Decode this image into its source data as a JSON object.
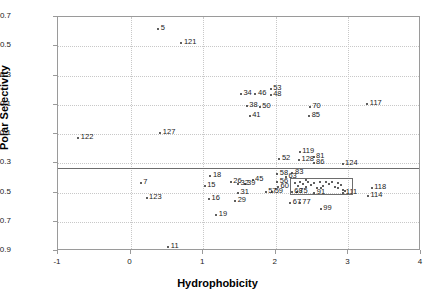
{
  "chart_data": {
    "type": "scatter",
    "title": "",
    "xlabel": "Hydrophobicity",
    "ylabel": "Polar Selectivity",
    "xlim": [
      -1,
      4
    ],
    "ylim": [
      -0.9,
      0.7
    ],
    "xticks": [
      "-1",
      "0",
      "1",
      "2",
      "3",
      "4"
    ],
    "xtick_values": [
      -1,
      0,
      1,
      2,
      3,
      4
    ],
    "yticks": [
      "0.7",
      "0.5",
      "0.3",
      "0.1",
      "-0.1",
      "-0.3",
      "-0.5",
      "-0.7",
      "-0.9"
    ],
    "ytick_values": [
      0.7,
      0.5,
      0.3,
      0.1,
      -0.1,
      -0.3,
      -0.5,
      -0.7,
      -0.9
    ],
    "grid": "dotted-both",
    "legend": "none",
    "marker_color": "#2a2a2a",
    "reference_line": {
      "orientation": "horizontal",
      "y": -0.33,
      "color": "#6d6d6d"
    },
    "inset_box": {
      "x0": 2.2,
      "x1": 3.06,
      "y0": -0.52,
      "y1": -0.4,
      "color": "#6d6d6d"
    },
    "labeled_points": [
      {
        "label": "5",
        "x": 0.38,
        "y": 0.615
      },
      {
        "label": "121",
        "x": 0.7,
        "y": 0.525
      },
      {
        "label": "122",
        "x": -0.72,
        "y": -0.125
      },
      {
        "label": "127",
        "x": 0.41,
        "y": -0.09
      },
      {
        "label": "34",
        "x": 1.52,
        "y": 0.175
      },
      {
        "label": "46",
        "x": 1.72,
        "y": 0.175
      },
      {
        "label": "53",
        "x": 1.93,
        "y": 0.205
      },
      {
        "label": "48",
        "x": 1.93,
        "y": 0.165
      },
      {
        "label": "38",
        "x": 1.6,
        "y": 0.09
      },
      {
        "label": "50",
        "x": 1.78,
        "y": 0.085
      },
      {
        "label": "41",
        "x": 1.64,
        "y": 0.02
      },
      {
        "label": "70",
        "x": 2.47,
        "y": 0.085
      },
      {
        "label": "85",
        "x": 2.46,
        "y": 0.025
      },
      {
        "label": "117",
        "x": 3.26,
        "y": 0.105
      },
      {
        "label": "119",
        "x": 2.33,
        "y": -0.225
      },
      {
        "label": "128",
        "x": 2.32,
        "y": -0.275
      },
      {
        "label": "81",
        "x": 2.52,
        "y": -0.255
      },
      {
        "label": "86",
        "x": 2.52,
        "y": -0.295
      },
      {
        "label": "124",
        "x": 2.92,
        "y": -0.305
      },
      {
        "label": "52",
        "x": 2.05,
        "y": -0.27
      },
      {
        "label": "58",
        "x": 2.02,
        "y": -0.375
      },
      {
        "label": "83",
        "x": 2.23,
        "y": -0.365
      },
      {
        "label": "63",
        "x": 2.14,
        "y": -0.395
      },
      {
        "label": "56",
        "x": 2.02,
        "y": -0.425
      },
      {
        "label": "60",
        "x": 2.03,
        "y": -0.465
      },
      {
        "label": "18",
        "x": 1.1,
        "y": -0.385
      },
      {
        "label": "26",
        "x": 1.38,
        "y": -0.43
      },
      {
        "label": "32",
        "x": 1.48,
        "y": -0.44
      },
      {
        "label": "39",
        "x": 1.57,
        "y": -0.44
      },
      {
        "label": "45",
        "x": 1.68,
        "y": -0.415
      },
      {
        "label": "15",
        "x": 1.02,
        "y": -0.455
      },
      {
        "label": "31",
        "x": 1.48,
        "y": -0.5
      },
      {
        "label": "29",
        "x": 1.44,
        "y": -0.555
      },
      {
        "label": "16",
        "x": 1.08,
        "y": -0.545
      },
      {
        "label": "19",
        "x": 1.18,
        "y": -0.655
      },
      {
        "label": "57",
        "x": 1.86,
        "y": -0.495
      },
      {
        "label": "59",
        "x": 1.95,
        "y": -0.495
      },
      {
        "label": "68",
        "x": 2.22,
        "y": -0.495
      },
      {
        "label": "75",
        "x": 2.29,
        "y": -0.495
      },
      {
        "label": "91",
        "x": 2.53,
        "y": -0.5
      },
      {
        "label": "111",
        "x": 2.93,
        "y": -0.505
      },
      {
        "label": "67",
        "x": 2.2,
        "y": -0.575
      },
      {
        "label": "77",
        "x": 2.33,
        "y": -0.575
      },
      {
        "label": "99",
        "x": 2.62,
        "y": -0.615
      },
      {
        "label": "7",
        "x": 0.14,
        "y": -0.435
      },
      {
        "label": "123",
        "x": 0.22,
        "y": -0.535
      },
      {
        "label": "11",
        "x": 0.52,
        "y": -0.875
      },
      {
        "label": "118",
        "x": 3.32,
        "y": -0.47
      },
      {
        "label": "114",
        "x": 3.27,
        "y": -0.525
      }
    ],
    "inset_cluster_points": [
      {
        "x": 2.26,
        "y": -0.435
      },
      {
        "x": 2.3,
        "y": -0.455
      },
      {
        "x": 2.34,
        "y": -0.425
      },
      {
        "x": 2.38,
        "y": -0.445
      },
      {
        "x": 2.42,
        "y": -0.465
      },
      {
        "x": 2.45,
        "y": -0.425
      },
      {
        "x": 2.49,
        "y": -0.45
      },
      {
        "x": 2.53,
        "y": -0.435
      },
      {
        "x": 2.57,
        "y": -0.47
      },
      {
        "x": 2.61,
        "y": -0.43
      },
      {
        "x": 2.65,
        "y": -0.455
      },
      {
        "x": 2.69,
        "y": -0.425
      },
      {
        "x": 2.73,
        "y": -0.445
      },
      {
        "x": 2.77,
        "y": -0.43
      },
      {
        "x": 2.81,
        "y": -0.46
      },
      {
        "x": 2.85,
        "y": -0.435
      },
      {
        "x": 2.9,
        "y": -0.45
      },
      {
        "x": 2.93,
        "y": -0.48
      },
      {
        "x": 2.95,
        "y": -0.49
      },
      {
        "x": 2.42,
        "y": -0.415
      },
      {
        "x": 2.62,
        "y": -0.47
      },
      {
        "x": 2.86,
        "y": -0.47
      }
    ]
  }
}
